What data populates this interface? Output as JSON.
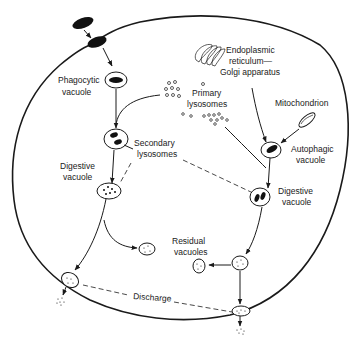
{
  "diagram": {
    "labels": {
      "phagocytic_vacuole_1": "Phagocytic",
      "phagocytic_vacuole_2": "vacuole",
      "er_1": "Endoplasmic",
      "er_2": "reticulum—",
      "er_3": "Golgi apparatus",
      "primary_lyso_1": "Primary",
      "primary_lyso_2": "lysosomes",
      "mitochondrion": "Mitochondrion",
      "secondary_lyso_1": "Secondary",
      "secondary_lyso_2": "lysosomes",
      "autophagic_1": "Autophagic",
      "autophagic_2": "vacuole",
      "digestive_left_1": "Digestive",
      "digestive_left_2": "vacuole",
      "digestive_right_1": "Digestive",
      "digestive_right_2": "vacuole",
      "residual_1": "Residual",
      "residual_2": "vacuoles",
      "discharge": "Discharge"
    },
    "nodes": [
      "External particle",
      "Phagocytic vacuole",
      "Endoplasmic reticulum—Golgi apparatus",
      "Primary lysosomes",
      "Mitochondrion",
      "Secondary lysosomes",
      "Autophagic vacuole",
      "Digestive vacuole (heterophagic)",
      "Digestive vacuole (autophagic)",
      "Residual vacuoles",
      "Discharge"
    ],
    "edges": [
      [
        "External particle",
        "Phagocytic vacuole"
      ],
      [
        "Phagocytic vacuole",
        "Digestive vacuole (heterophagic)"
      ],
      [
        "Primary lysosomes",
        "Digestive vacuole (heterophagic)"
      ],
      [
        "Endoplasmic reticulum—Golgi apparatus",
        "Autophagic vacuole"
      ],
      [
        "Mitochondrion",
        "Autophagic vacuole"
      ],
      [
        "Primary lysosomes",
        "Digestive vacuole (autophagic)"
      ],
      [
        "Autophagic vacuole",
        "Digestive vacuole (autophagic)"
      ],
      [
        "Digestive vacuole (heterophagic)",
        "Residual vacuoles"
      ],
      [
        "Digestive vacuole (autophagic)",
        "Residual vacuoles"
      ],
      [
        "Residual vacuoles",
        "Discharge"
      ]
    ]
  }
}
